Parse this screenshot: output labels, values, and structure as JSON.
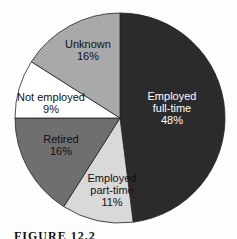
{
  "chart_data": {
    "type": "pie",
    "title": "",
    "start_angle": "12 o'clock",
    "direction": "clockwise",
    "categories": [
      "Employed full-time",
      "Employed part-time",
      "Retired",
      "Not employed",
      "Unknown"
    ],
    "values": [
      48,
      11,
      16,
      9,
      16
    ],
    "unit": "%",
    "colors": [
      "#2b2b2b",
      "#d9d9d9",
      "#6f6f6f",
      "#ffffff",
      "#a9a9a9"
    ],
    "labels": [
      {
        "lines": [
          "Employed",
          "full-time",
          "48%"
        ],
        "color": "#ffffff"
      },
      {
        "lines": [
          "Employed",
          "part-time",
          "11%"
        ],
        "color": "#111111"
      },
      {
        "lines": [
          "Retired",
          "16%"
        ],
        "color": "#111111"
      },
      {
        "lines": [
          "Not employed",
          "9%"
        ],
        "color": "#111111"
      },
      {
        "lines": [
          "Unknown",
          "16%"
        ],
        "color": "#111111"
      }
    ],
    "legend": "none (inline labels)"
  },
  "caption": "FIGURE 12.2"
}
